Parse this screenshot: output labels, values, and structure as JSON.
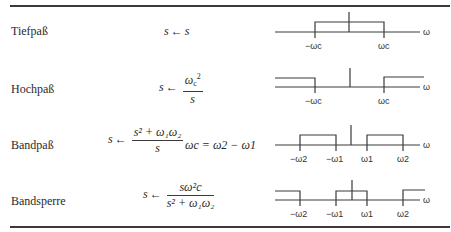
{
  "table": {
    "rows": [
      {
        "label": "Tiefpaß",
        "formula": {
          "lhs": "s",
          "arrow": "←",
          "rhs": "s"
        },
        "diagram": {
          "ticks": [
            "−ωc",
            "ωc"
          ],
          "axis_label": "ω"
        }
      },
      {
        "label": "Hochpaß",
        "formula": {
          "lhs": "s",
          "arrow": "←",
          "num_base": "ω",
          "num_sub": "c",
          "num_sup": "2",
          "den": "s"
        },
        "diagram": {
          "ticks": [
            "−ωc",
            "ωc"
          ],
          "axis_label": "ω"
        }
      },
      {
        "label": "Bandpaß",
        "formula": {
          "lhs": "s",
          "arrow": "←",
          "num": "s² + ω₁ω₂",
          "den": "s"
        },
        "note": "ωc = ω2 − ω1",
        "diagram": {
          "ticks": [
            "−ω2",
            "−ω1",
            "ω1",
            "ω2"
          ],
          "axis_label": "ω"
        }
      },
      {
        "label": "Bandsperre",
        "formula": {
          "lhs": "s",
          "arrow": "←",
          "num": "sω²c",
          "den": "s² + ω₁ω₂"
        },
        "diagram": {
          "ticks": [
            "−ω2",
            "−ω1",
            "ω1",
            "ω2"
          ],
          "axis_label": "ω"
        }
      }
    ]
  }
}
